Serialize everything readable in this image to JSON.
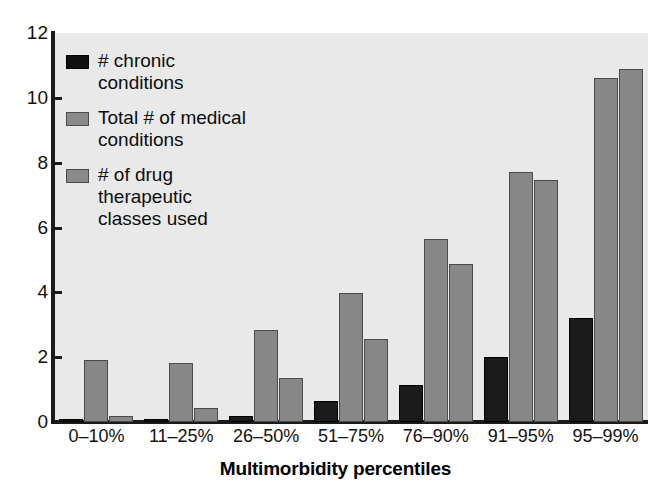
{
  "chart_data": {
    "type": "bar",
    "title": "",
    "subtitle": "",
    "xlabel": "Multimorbidity percentiles",
    "ylabel": "",
    "categories": [
      "0–10%",
      "11–25%",
      "26–50%",
      "51–75%",
      "76–90%",
      "91–95%",
      "95–99%"
    ],
    "series": [
      {
        "name": "# chronic conditions",
        "color": "#1a1a1a",
        "values": [
          0.08,
          0.08,
          0.2,
          0.65,
          1.15,
          2.0,
          3.2
        ]
      },
      {
        "name": "Total # of medical conditions",
        "color": "#878787",
        "values": [
          1.9,
          1.83,
          2.85,
          3.97,
          5.65,
          7.72,
          10.6
        ]
      },
      {
        "name": "# of drug therapeutic classes used",
        "color": "#878787",
        "values": [
          0.2,
          0.42,
          1.35,
          2.55,
          4.87,
          7.46,
          10.9
        ]
      }
    ],
    "ylim": [
      0,
      12
    ],
    "yticks": [
      0,
      2,
      4,
      6,
      8,
      10,
      12
    ],
    "ytick_labels": [
      "0",
      "2",
      "4",
      "6",
      "8",
      "10",
      "12"
    ],
    "grid": false,
    "legend_position": "upper-left",
    "plot_background": "#e9e9e9",
    "axis_color": "#1a1a1a"
  },
  "legend": {
    "items": [
      {
        "label": "# chronic conditions",
        "swatch": "black-swatch"
      },
      {
        "label": "Total # of medical conditions",
        "swatch": "gray-swatch"
      },
      {
        "label": "# of drug therapeutic classes used",
        "swatch": "gray-swatch"
      }
    ]
  }
}
